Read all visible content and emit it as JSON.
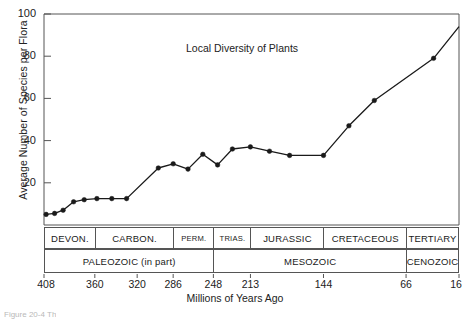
{
  "figure": {
    "caption_partial": "Figure 20-4   Th"
  },
  "chart_data": {
    "type": "line",
    "title": "Local Diversity of Plants",
    "xlabel": "Millions of Years Ago",
    "ylabel": "Average Number of Species per Flora",
    "xlim": [
      408,
      16
    ],
    "ylim": [
      0,
      100
    ],
    "x_reversed": true,
    "grid": false,
    "legend": "none",
    "yticks": [
      20,
      40,
      60,
      80,
      100
    ],
    "xticks": [
      408,
      360,
      320,
      286,
      248,
      213,
      144,
      66,
      16
    ],
    "x": [
      406,
      398,
      390,
      380,
      370,
      358,
      344,
      330,
      316,
      300,
      286,
      272,
      258,
      244,
      230,
      213,
      195,
      176,
      160,
      144,
      120,
      96,
      66,
      40,
      16
    ],
    "values": [
      5,
      5.5,
      7,
      11,
      12,
      12.5,
      12.5,
      12.5,
      12.5,
      27,
      29,
      26.5,
      33.5,
      28.5,
      36,
      37,
      35,
      33,
      33,
      33,
      47,
      59,
      66,
      79,
      94
    ],
    "series": [
      {
        "name": "Average number of species per flora",
        "marker": "filled-circle",
        "line_color": "#1a1a1a",
        "points": [
          {
            "x": 406,
            "y": 5
          },
          {
            "x": 398,
            "y": 5.5
          },
          {
            "x": 390,
            "y": 7
          },
          {
            "x": 380,
            "y": 11
          },
          {
            "x": 370,
            "y": 12
          },
          {
            "x": 358,
            "y": 12.5
          },
          {
            "x": 344,
            "y": 12.5
          },
          {
            "x": 330,
            "y": 12.5
          },
          {
            "x": 300,
            "y": 27
          },
          {
            "x": 286,
            "y": 29
          },
          {
            "x": 272,
            "y": 26.5
          },
          {
            "x": 258,
            "y": 33.5
          },
          {
            "x": 244,
            "y": 28.5
          },
          {
            "x": 230,
            "y": 36
          },
          {
            "x": 213,
            "y": 37
          },
          {
            "x": 195,
            "y": 35
          },
          {
            "x": 176,
            "y": 33
          },
          {
            "x": 144,
            "y": 33
          },
          {
            "x": 120,
            "y": 47
          },
          {
            "x": 96,
            "y": 59
          },
          {
            "x": 40,
            "y": 79
          }
        ]
      }
    ],
    "timescale": {
      "periods": [
        {
          "label": "DEVON.",
          "start": 408,
          "end": 360
        },
        {
          "label": "CARBON.",
          "start": 360,
          "end": 286
        },
        {
          "label": "PERM.",
          "start": 286,
          "end": 248
        },
        {
          "label": "TRIAS.",
          "start": 248,
          "end": 213
        },
        {
          "label": "JURASSIC",
          "start": 213,
          "end": 144
        },
        {
          "label": "CRETACEOUS",
          "start": 144,
          "end": 66
        },
        {
          "label": "TERTIARY",
          "start": 66,
          "end": 16
        }
      ],
      "eras": [
        {
          "label": "PALEOZOIC (in part)",
          "start": 408,
          "end": 248
        },
        {
          "label": "MESOZOIC",
          "start": 248,
          "end": 66
        },
        {
          "label": "CENOZOIC",
          "start": 66,
          "end": 16
        }
      ]
    }
  }
}
